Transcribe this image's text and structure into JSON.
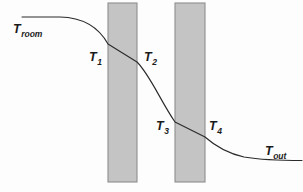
{
  "figure": {
    "width": 303,
    "height": 192,
    "background_color": "#fdfdfd",
    "curve_color": "#2b2b2b",
    "wall_fill_color": "#c4c4c4",
    "wall_border_color": "#8e8e8e"
  },
  "walls": [
    {
      "name": "wall-1",
      "x": 108,
      "y": 3,
      "width": 29,
      "height": 179
    },
    {
      "name": "wall-2",
      "x": 175,
      "y": 3,
      "width": 30,
      "height": 179
    }
  ],
  "curve": {
    "description": "Temperature drops from room air, through wall 1, across the air gap, through wall 2, then levels off at outdoor air temperature.",
    "path": "M 22,17 L 60,17 C 82,17.5 98,26 108,44 L 137,62 C 150,75 160,100 175,122 L 205,137 C 214,145 226,153 244,157 C 262,160 285,160.5 302,160.5"
  },
  "labels": [
    {
      "name": "label-t-room",
      "base": "T",
      "sub": "room",
      "x": 13,
      "y": 20,
      "size": "normal"
    },
    {
      "name": "label-t1",
      "base": "T",
      "sub": "1",
      "x": 89,
      "y": 48,
      "size": "normal"
    },
    {
      "name": "label-t2",
      "base": "T",
      "sub": "2",
      "x": 144,
      "y": 48,
      "size": "normal"
    },
    {
      "name": "label-t3",
      "base": "T",
      "sub": "3",
      "x": 156,
      "y": 117,
      "size": "normal"
    },
    {
      "name": "label-t4",
      "base": "T",
      "sub": "4",
      "x": 209,
      "y": 117,
      "size": "normal"
    },
    {
      "name": "label-t-out",
      "base": "T",
      "sub": "out",
      "x": 265,
      "y": 142,
      "size": "normal"
    }
  ]
}
